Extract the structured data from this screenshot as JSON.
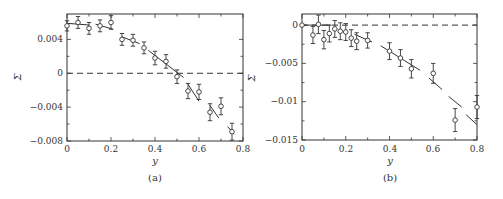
{
  "chart_data": [
    {
      "type": "scatter",
      "panel_label": "(a)",
      "title": "",
      "xlabel": "y",
      "ylabel": "Σ",
      "xlim": [
        0,
        0.8
      ],
      "ylim": [
        -0.008,
        0.007
      ],
      "xticks": [
        "0",
        "0.2",
        "0.4",
        "0.6",
        "0.8"
      ],
      "yticks": [
        "0.004",
        "0",
        "−0.004",
        "−0.008"
      ],
      "grid": false,
      "reference_line": {
        "y": 0,
        "style": "dashed"
      },
      "series": [
        {
          "name": "data",
          "marker": "circle",
          "x": [
            0,
            0.05,
            0.1,
            0.15,
            0.2,
            0.25,
            0.3,
            0.35,
            0.4,
            0.45,
            0.5,
            0.55,
            0.6,
            0.65,
            0.7,
            0.75
          ],
          "values": [
            0.0056,
            0.006,
            0.0053,
            0.0056,
            0.006,
            0.004,
            0.0039,
            0.003,
            0.0018,
            0.0014,
            -0.0004,
            -0.0021,
            -0.0022,
            -0.0046,
            -0.0039,
            -0.0069
          ],
          "error": [
            0.0006,
            0.0007,
            0.0007,
            0.0007,
            0.0008,
            0.0007,
            0.0007,
            0.0007,
            0.0008,
            0.0008,
            0.0008,
            0.0009,
            0.0009,
            0.001,
            0.001,
            0.001
          ]
        }
      ],
      "fit_segments": [
        {
          "x": [
            0.0,
            0.1
          ],
          "y": [
            0.0059,
            0.0057
          ]
        },
        {
          "x": [
            0.13,
            0.21
          ],
          "y": [
            0.0058,
            0.0052
          ]
        },
        {
          "x": [
            0.25,
            0.33
          ],
          "y": [
            0.0043,
            0.0035
          ]
        },
        {
          "x": [
            0.37,
            0.53
          ],
          "y": [
            0.0027,
            -0.0005
          ]
        },
        {
          "x": [
            0.55,
            0.6
          ],
          "y": [
            -0.0013,
            -0.0033
          ]
        },
        {
          "x": [
            0.65,
            0.69
          ],
          "y": [
            -0.0038,
            -0.0053
          ]
        },
        {
          "x": [
            0.73,
            0.76
          ],
          "y": [
            -0.0063,
            -0.0072
          ]
        }
      ]
    },
    {
      "type": "scatter",
      "panel_label": "(b)",
      "title": "",
      "xlabel": "y",
      "ylabel": "Σ",
      "xlim": [
        0,
        0.8
      ],
      "ylim": [
        -0.015,
        0.0015
      ],
      "xticks": [
        "0",
        "0.2",
        "0.4",
        "0.6",
        "0.8"
      ],
      "yticks": [
        "0",
        "−0.005",
        "−0.01",
        "−0.015"
      ],
      "grid": false,
      "reference_line": {
        "y": 0,
        "style": "dashed"
      },
      "series": [
        {
          "name": "data",
          "marker": "circle",
          "x": [
            0,
            0.05,
            0.075,
            0.1,
            0.125,
            0.15,
            0.175,
            0.2,
            0.225,
            0.25,
            0.3,
            0.4,
            0.45,
            0.5,
            0.6,
            0.7,
            0.8
          ],
          "values": [
            0.0,
            -0.0013,
            0.0001,
            -0.0019,
            -0.0011,
            -0.0005,
            -0.0008,
            -0.0009,
            -0.0017,
            -0.0021,
            -0.002,
            -0.0034,
            -0.0043,
            -0.0057,
            -0.0063,
            -0.0124,
            -0.0107
          ],
          "error": [
            0.0,
            0.0011,
            0.0012,
            0.0012,
            0.0011,
            0.0011,
            0.0011,
            0.0011,
            0.0011,
            0.0011,
            0.001,
            0.0011,
            0.0011,
            0.0012,
            0.0013,
            0.0015,
            0.0015
          ]
        }
      ],
      "fit_segments": [
        {
          "x": [
            0.0,
            0.13
          ],
          "y": [
            0.0,
            0.0
          ]
        },
        {
          "x": [
            0.24,
            0.32
          ],
          "y": [
            -0.0012,
            -0.0022
          ]
        },
        {
          "x": [
            0.36,
            0.54
          ],
          "y": [
            -0.0027,
            -0.0059
          ]
        },
        {
          "x": [
            0.58,
            0.64
          ],
          "y": [
            -0.0069,
            -0.0084
          ]
        },
        {
          "x": [
            0.67,
            0.73
          ],
          "y": [
            -0.0093,
            -0.0107
          ]
        },
        {
          "x": [
            0.75,
            0.8
          ],
          "y": [
            -0.0117,
            -0.013
          ]
        }
      ]
    }
  ],
  "figure": {
    "panel_a": {
      "caption": "(a)",
      "xlabel": "y",
      "ylabel": "Σ",
      "xticks": [
        "0",
        "0.2",
        "0.4",
        "0.6",
        "0.8"
      ],
      "yticks": [
        "0.004",
        "0",
        "−0.004",
        "−0.008"
      ]
    },
    "panel_b": {
      "caption": "(b)",
      "xlabel": "y",
      "ylabel": "Σ",
      "xticks": [
        "0",
        "0.2",
        "0.4",
        "0.6",
        "0.8"
      ],
      "yticks": [
        "0",
        "−0.005",
        "−0.01",
        "−0.015"
      ]
    }
  }
}
